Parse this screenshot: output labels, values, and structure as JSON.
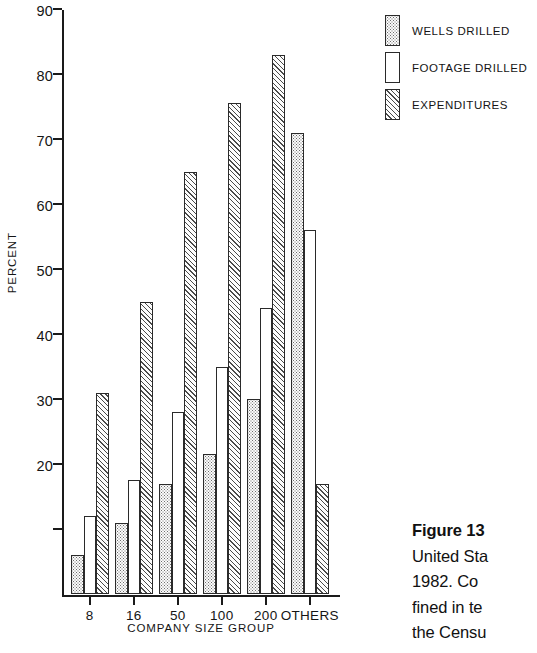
{
  "chart_data": {
    "type": "bar",
    "title": "",
    "xlabel": "COMPANY SIZE GROUP",
    "ylabel": "PERCENT",
    "ylim": [
      0,
      90
    ],
    "yticks": [
      0,
      10,
      20,
      30,
      40,
      50,
      60,
      70,
      80,
      90
    ],
    "ytick_labels": [
      "",
      "",
      "20",
      "30",
      "40",
      "50",
      "60",
      "70",
      "80",
      "90"
    ],
    "grid": false,
    "legend_position": "top-right",
    "categories": [
      "8",
      "16",
      "50",
      "100",
      "200",
      "OTHERS"
    ],
    "series": [
      {
        "name": "WELLS DRILLED",
        "fill": "stipple",
        "values": [
          6,
          11,
          17,
          21.5,
          30,
          71
        ]
      },
      {
        "name": "FOOTAGE DRILLED",
        "fill": "open",
        "values": [
          12,
          17.5,
          28,
          35,
          44,
          56
        ]
      },
      {
        "name": "EXPENDITURES",
        "fill": "hatch",
        "values": [
          31,
          45,
          65,
          75.5,
          83,
          17
        ]
      }
    ]
  },
  "axes": {
    "y_title": "PERCENT",
    "x_title": "COMPANY SIZE GROUP",
    "y_labels": [
      {
        "value": 90,
        "text": "90"
      },
      {
        "value": 80,
        "text": "80"
      },
      {
        "value": 70,
        "text": "70"
      },
      {
        "value": 60,
        "text": "60"
      },
      {
        "value": 50,
        "text": "50"
      },
      {
        "value": 40,
        "text": "40"
      },
      {
        "value": 30,
        "text": "30"
      },
      {
        "value": 20,
        "text": "20"
      }
    ],
    "y_unlabeled_ticks": [
      10
    ],
    "x_labels": [
      "8",
      "16",
      "50",
      "100",
      "200",
      "OTHERS"
    ]
  },
  "legend": {
    "items": [
      {
        "label": "WELLS DRILLED",
        "fill": "stipple"
      },
      {
        "label": "FOOTAGE DRILLED",
        "fill": "open"
      },
      {
        "label": "EXPENDITURES",
        "fill": "hatch"
      }
    ]
  },
  "caption": {
    "lines": [
      "Figure 13",
      "United Sta",
      "1982. Co",
      "fined in te",
      "the Censu"
    ],
    "heading": "Figure 13",
    "line1": "United Sta",
    "line2": "1982. Co",
    "line3": "fined in te",
    "line4": "the Censu"
  }
}
